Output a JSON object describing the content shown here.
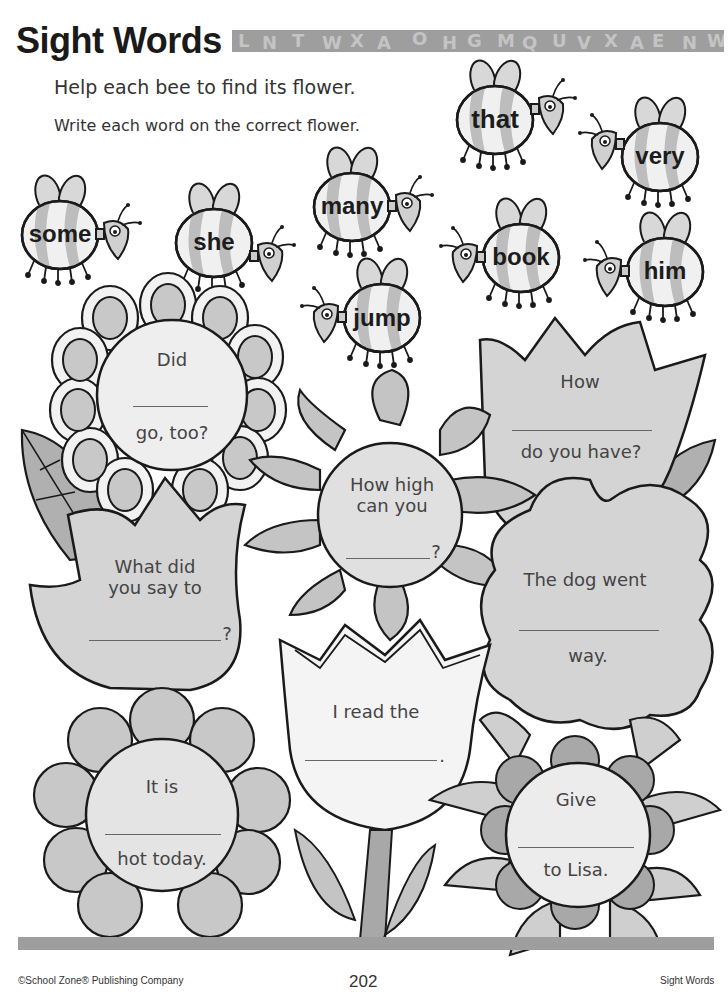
{
  "header": {
    "title": "Sight Words",
    "banner_letters": [
      "L",
      "N",
      "T",
      "U",
      "W",
      "X",
      "A",
      "O",
      "H",
      "G",
      "M",
      "Q",
      "R",
      "U",
      "V",
      "X",
      "A",
      "E",
      "N",
      "W",
      "V",
      "M",
      "Q"
    ]
  },
  "instructions": {
    "line1": "Help each bee to find its flower.",
    "line2": "Write each word on the correct flower."
  },
  "bees": [
    {
      "word": "some"
    },
    {
      "word": "she"
    },
    {
      "word": "many"
    },
    {
      "word": "jump"
    },
    {
      "word": "that"
    },
    {
      "word": "very"
    },
    {
      "word": "book"
    },
    {
      "word": "him"
    }
  ],
  "flowers": [
    {
      "before": "Did",
      "after": "go, too?"
    },
    {
      "before": "How",
      "after": "do you have?"
    },
    {
      "before": "How high can you",
      "after": "?"
    },
    {
      "before": "What did you say to",
      "after": "?"
    },
    {
      "before": "The dog went",
      "after": "way."
    },
    {
      "before": "I read the",
      "after": "."
    },
    {
      "before": "It is",
      "after": "hot today."
    },
    {
      "before": "Give",
      "after": "to Lisa."
    }
  ],
  "footer": {
    "publisher": "©School Zone® Publishing Company",
    "page_number": "202",
    "section": "Sight Words"
  },
  "colors": {
    "light_fill": "#e8e8e8",
    "mid_fill": "#c8c8c8",
    "dark_fill": "#a8a8a8",
    "outline": "#1a1a1a",
    "banner": "#9e9e9e"
  }
}
